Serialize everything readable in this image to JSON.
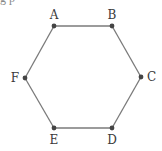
{
  "diagram": {
    "type": "graph",
    "shape": "hexagon",
    "caption_partial": "g p",
    "edge_color": "#7a7a7a",
    "vertex_color": "#444444",
    "vertices": [
      {
        "id": "A",
        "label": "A",
        "x": 54,
        "y": 26,
        "lx": 54,
        "ly": 19,
        "anchor": "middle"
      },
      {
        "id": "B",
        "label": "B",
        "x": 112,
        "y": 26,
        "lx": 112,
        "ly": 19,
        "anchor": "middle"
      },
      {
        "id": "C",
        "label": "C",
        "x": 141,
        "y": 77,
        "lx": 147,
        "ly": 81,
        "anchor": "start"
      },
      {
        "id": "D",
        "label": "D",
        "x": 112,
        "y": 128,
        "lx": 112,
        "ly": 144,
        "anchor": "middle"
      },
      {
        "id": "E",
        "label": "E",
        "x": 54,
        "y": 128,
        "lx": 54,
        "ly": 144,
        "anchor": "middle"
      },
      {
        "id": "F",
        "label": "F",
        "x": 25,
        "y": 78,
        "lx": 19,
        "ly": 82,
        "anchor": "end"
      }
    ],
    "edges": [
      [
        "A",
        "B"
      ],
      [
        "B",
        "C"
      ],
      [
        "C",
        "D"
      ],
      [
        "D",
        "E"
      ],
      [
        "E",
        "F"
      ],
      [
        "F",
        "A"
      ]
    ]
  }
}
